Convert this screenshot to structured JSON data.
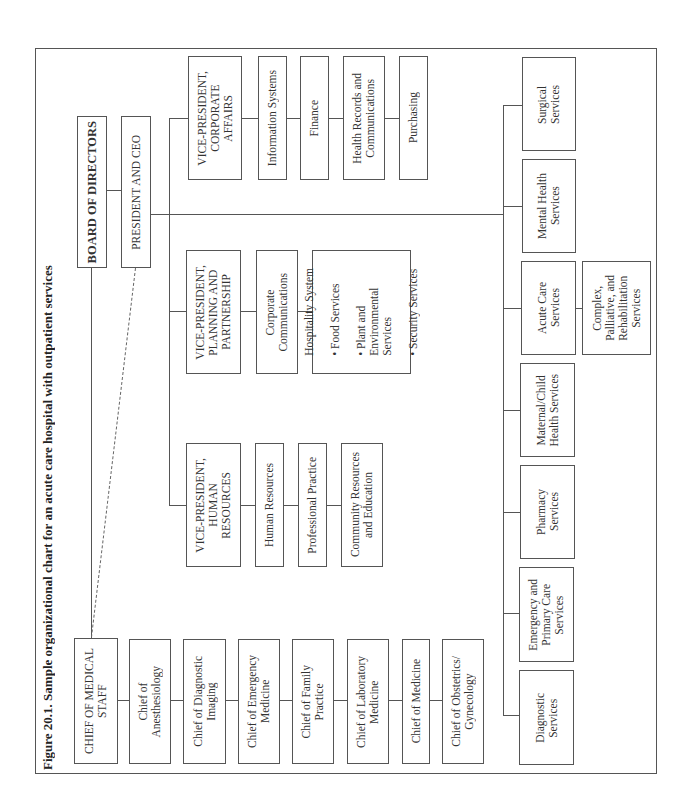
{
  "figure": {
    "title": "Figure 20.1.   Sample organizational chart for an acute care hospital with outpatient services"
  },
  "top": {
    "board": "BOARD OF DIRECTORS",
    "ceo": "PRESIDENT AND CEO",
    "chief_medical_staff": "CHIEF OF MEDICAL\nSTAFF"
  },
  "chiefs": [
    "Chief of\nAnesthesiology",
    "Chief of Diagnostic\nImaging",
    "Chief of Emergency\nMedicine",
    "Chief of Family\nPractice",
    "Chief of Laboratory\nMedicine",
    "Chief of Medicine",
    "Chief of Obstetrics/\nGynecology"
  ],
  "vp_corporate_affairs": {
    "title": "VICE-PRESIDENT,\nCORPORATE\nAFFAIRS",
    "units": [
      "Information Systems",
      "Finance",
      "Health Records and\nCommunications",
      "Purchasing"
    ]
  },
  "vp_planning": {
    "title": "VICE-PRESIDENT,\nPLANNING AND\nPARTNERSHIP",
    "units": [
      "Corporate\nCommunications"
    ],
    "hospitality": {
      "heading": "Hospitality System",
      "items": [
        "Food Services",
        "Plant and\n   Environmental\n   Services",
        "Security Services"
      ]
    }
  },
  "vp_hr": {
    "title": "VICE-PRESIDENT,\nHUMAN\nRESOURCES",
    "units": [
      "Human Resources",
      "Professional Practice",
      "Community Resources\nand Education"
    ]
  },
  "services": {
    "diagnostic": "Diagnostic\nServices",
    "emergency_primary": "Emergency and\nPrimary Care\nServices",
    "pharmacy": "Pharmacy\nServices",
    "maternal_child": "Maternal/Child\nHealth Services",
    "acute_care": "Acute Care\nServices",
    "complex": "Complex,\nPalliative, and\nRehabilitation\nServices",
    "mental_health": "Mental Health\nServices",
    "surgical": "Surgical\nServices"
  },
  "bullet": "•"
}
